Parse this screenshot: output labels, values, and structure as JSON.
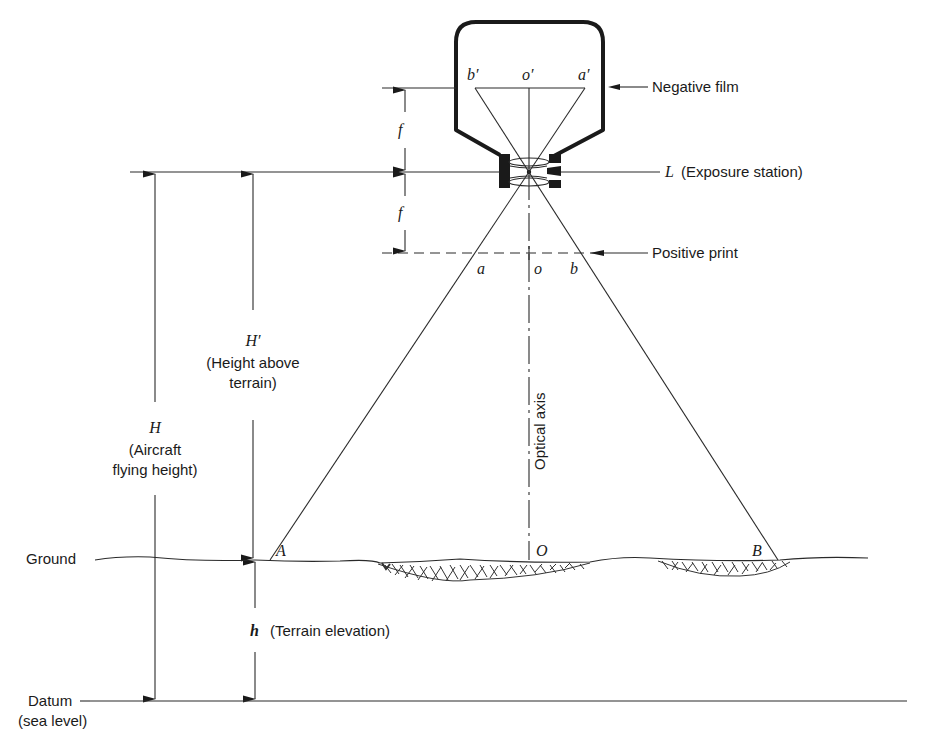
{
  "figure": {
    "labels": {
      "negative_film": "Negative film",
      "exposure_station_symbol": "L",
      "exposure_station": "(Exposure station)",
      "positive_print": "Positive print",
      "focal_length_top": "f",
      "focal_length_bottom": "f",
      "b_prime": "b′",
      "o_prime": "o′",
      "a_prime": "a′",
      "a": "a",
      "o": "o",
      "b": "b",
      "ground_A": "A",
      "ground_O": "O",
      "ground_B": "B",
      "optical_axis": "Optical axis",
      "H_prime_symbol": "H′",
      "H_prime_line1": "(Height above",
      "H_prime_line2": "terrain)",
      "H_symbol": "H",
      "H_line1": "(Aircraft",
      "H_line2": "flying height)",
      "ground": "Ground",
      "datum_line1": "Datum",
      "datum_line2": "(sea level)",
      "h_symbol": "h",
      "h_label": "(Terrain elevation)"
    },
    "colors": {
      "ink": "#1a1a1a",
      "background": "#ffffff"
    }
  }
}
